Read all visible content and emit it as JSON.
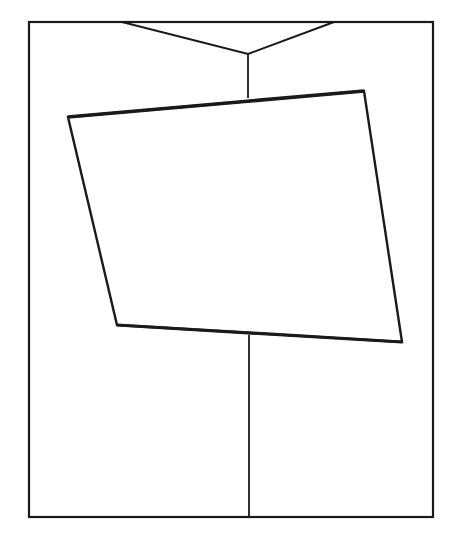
{
  "figure": {
    "colors": {
      "background": "#ffffff",
      "stroke": "#1a1a1a"
    },
    "frame": {
      "x1": 29,
      "y1": 22,
      "x2": 433,
      "y2": 517
    },
    "hanger": {
      "left_top": [
        122,
        22
      ],
      "right_top": [
        334,
        22
      ],
      "junction": [
        248,
        54
      ],
      "stem_bottom": [
        248,
        98
      ]
    },
    "panel": {
      "top_left": [
        68,
        117
      ],
      "top_right": [
        364,
        91
      ],
      "bottom_right": [
        402,
        342
      ],
      "bottom_left": [
        117,
        325
      ]
    },
    "bottom_line": {
      "top": [
        249,
        335
      ],
      "bottom": [
        249,
        517
      ]
    }
  }
}
